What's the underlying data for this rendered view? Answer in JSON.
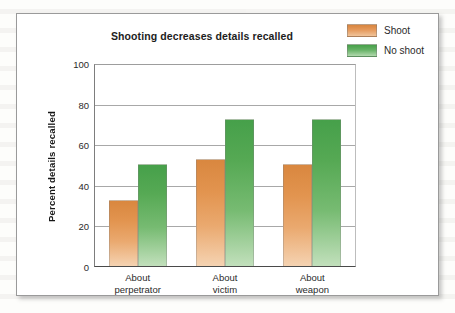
{
  "figure": {
    "title": "Shooting decreases details recalled"
  },
  "legend": {
    "position": "top-right",
    "entries": [
      {
        "label": "Shoot",
        "color": "#e2944f",
        "icon": "legend-swatch-icon"
      },
      {
        "label": "No shoot",
        "color": "#56a954",
        "icon": "legend-swatch-icon"
      }
    ]
  },
  "axes": {
    "ylabel": "Percent details recalled",
    "xlabel": "",
    "yticks": [
      "0",
      "20",
      "40",
      "60",
      "80",
      "100"
    ],
    "ylim": [
      0,
      100
    ]
  },
  "chart_data": {
    "type": "bar",
    "title": "Shooting decreases details recalled",
    "xlabel": "",
    "ylabel": "Percent details recalled",
    "ylim": [
      0,
      100
    ],
    "ytick_values": [
      0,
      20,
      40,
      60,
      80,
      100
    ],
    "grid": "horizontal",
    "legend_position": "top-right",
    "categories": [
      "About perpetrator",
      "About victim",
      "About weapon"
    ],
    "category_lines": [
      [
        "About",
        "perpetrator"
      ],
      [
        "About",
        "victim"
      ],
      [
        "About",
        "weapon"
      ]
    ],
    "series": [
      {
        "name": "Shoot",
        "color": "#e2944f",
        "values": [
          33,
          53,
          51
        ]
      },
      {
        "name": "No shoot",
        "color": "#56a954",
        "values": [
          51,
          73,
          73
        ]
      }
    ]
  }
}
